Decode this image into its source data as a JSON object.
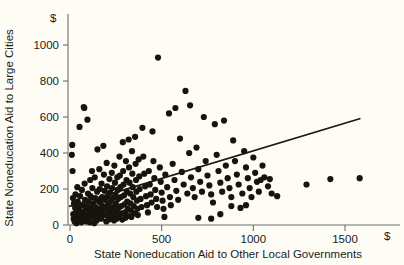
{
  "chart_data": {
    "type": "scatter",
    "title": "",
    "xlabel": "State Noneducation Aid to Other Local Governments",
    "ylabel": "State Noneducation Aid to Large Cities",
    "x_unit_symbol": "$",
    "y_unit_symbol": "$",
    "grid": false,
    "legend": null,
    "xlim": [
      0,
      1750
    ],
    "ylim": [
      0,
      1080
    ],
    "xticks": [
      0,
      500,
      1000,
      1500
    ],
    "yticks": [
      0,
      200,
      400,
      600,
      800,
      1000
    ],
    "xtick_labels": [
      "0",
      "500",
      "1000",
      "1500"
    ],
    "ytick_labels": [
      "0",
      "200",
      "400",
      "600",
      "800",
      "1000"
    ],
    "trendline": {
      "type": "linear-fit",
      "x_start": 0,
      "y_start": 105,
      "x_end": 1580,
      "y_end": 590
    },
    "points": [
      [
        10,
        390
      ],
      [
        12,
        445
      ],
      [
        14,
        300
      ],
      [
        16,
        150
      ],
      [
        18,
        60
      ],
      [
        20,
        35
      ],
      [
        22,
        120
      ],
      [
        25,
        20
      ],
      [
        28,
        95
      ],
      [
        30,
        170
      ],
      [
        32,
        55
      ],
      [
        35,
        10
      ],
      [
        38,
        80
      ],
      [
        40,
        210
      ],
      [
        42,
        130
      ],
      [
        45,
        45
      ],
      [
        48,
        25
      ],
      [
        50,
        100
      ],
      [
        52,
        545
      ],
      [
        55,
        160
      ],
      [
        58,
        75
      ],
      [
        60,
        40
      ],
      [
        62,
        15
      ],
      [
        65,
        195
      ],
      [
        68,
        110
      ],
      [
        70,
        60
      ],
      [
        72,
        30
      ],
      [
        75,
        655
      ],
      [
        78,
        650
      ],
      [
        80,
        230
      ],
      [
        82,
        140
      ],
      [
        85,
        85
      ],
      [
        88,
        50
      ],
      [
        90,
        20
      ],
      [
        92,
        105
      ],
      [
        95,
        585
      ],
      [
        98,
        175
      ],
      [
        100,
        130
      ],
      [
        102,
        70
      ],
      [
        105,
        45
      ],
      [
        108,
        15
      ],
      [
        110,
        250
      ],
      [
        112,
        160
      ],
      [
        115,
        95
      ],
      [
        118,
        55
      ],
      [
        120,
        300
      ],
      [
        122,
        205
      ],
      [
        125,
        120
      ],
      [
        128,
        80
      ],
      [
        130,
        40
      ],
      [
        132,
        10
      ],
      [
        135,
        265
      ],
      [
        138,
        150
      ],
      [
        140,
        100
      ],
      [
        142,
        60
      ],
      [
        145,
        25
      ],
      [
        148,
        185
      ],
      [
        150,
        420
      ],
      [
        152,
        135
      ],
      [
        155,
        90
      ],
      [
        158,
        50
      ],
      [
        160,
        310
      ],
      [
        162,
        200
      ],
      [
        165,
        125
      ],
      [
        168,
        75
      ],
      [
        170,
        35
      ],
      [
        172,
        230
      ],
      [
        175,
        155
      ],
      [
        178,
        105
      ],
      [
        180,
        65
      ],
      [
        182,
        440
      ],
      [
        185,
        280
      ],
      [
        188,
        190
      ],
      [
        190,
        140
      ],
      [
        192,
        95
      ],
      [
        195,
        55
      ],
      [
        198,
        20
      ],
      [
        200,
        345
      ],
      [
        202,
        215
      ],
      [
        205,
        160
      ],
      [
        208,
        115
      ],
      [
        210,
        70
      ],
      [
        212,
        30
      ],
      [
        215,
        255
      ],
      [
        218,
        180
      ],
      [
        220,
        130
      ],
      [
        222,
        85
      ],
      [
        225,
        45
      ],
      [
        228,
        290
      ],
      [
        230,
        205
      ],
      [
        232,
        150
      ],
      [
        235,
        100
      ],
      [
        238,
        60
      ],
      [
        240,
        25
      ],
      [
        242,
        330
      ],
      [
        245,
        235
      ],
      [
        248,
        170
      ],
      [
        250,
        120
      ],
      [
        252,
        75
      ],
      [
        255,
        35
      ],
      [
        258,
        265
      ],
      [
        260,
        195
      ],
      [
        262,
        145
      ],
      [
        265,
        95
      ],
      [
        268,
        55
      ],
      [
        270,
        380
      ],
      [
        272,
        275
      ],
      [
        275,
        210
      ],
      [
        278,
        155
      ],
      [
        280,
        105
      ],
      [
        282,
        65
      ],
      [
        285,
        30
      ],
      [
        288,
        460
      ],
      [
        290,
        300
      ],
      [
        292,
        225
      ],
      [
        295,
        165
      ],
      [
        298,
        115
      ],
      [
        300,
        70
      ],
      [
        302,
        40
      ],
      [
        305,
        355
      ],
      [
        308,
        250
      ],
      [
        310,
        185
      ],
      [
        312,
        130
      ],
      [
        315,
        90
      ],
      [
        318,
        50
      ],
      [
        320,
        475
      ],
      [
        322,
        320
      ],
      [
        325,
        235
      ],
      [
        328,
        175
      ],
      [
        330,
        120
      ],
      [
        332,
        80
      ],
      [
        335,
        45
      ],
      [
        338,
        410
      ],
      [
        340,
        285
      ],
      [
        342,
        210
      ],
      [
        345,
        155
      ],
      [
        348,
        105
      ],
      [
        350,
        65
      ],
      [
        355,
        490
      ],
      [
        358,
        340
      ],
      [
        360,
        250
      ],
      [
        362,
        185
      ],
      [
        365,
        135
      ],
      [
        368,
        90
      ],
      [
        370,
        55
      ],
      [
        375,
        365
      ],
      [
        378,
        270
      ],
      [
        380,
        200
      ],
      [
        385,
        145
      ],
      [
        390,
        100
      ],
      [
        395,
        540
      ],
      [
        400,
        380
      ],
      [
        405,
        285
      ],
      [
        410,
        215
      ],
      [
        415,
        160
      ],
      [
        420,
        110
      ],
      [
        425,
        70
      ],
      [
        430,
        300
      ],
      [
        435,
        225
      ],
      [
        440,
        170
      ],
      [
        445,
        125
      ],
      [
        450,
        520
      ],
      [
        455,
        355
      ],
      [
        460,
        260
      ],
      [
        465,
        195
      ],
      [
        470,
        145
      ],
      [
        475,
        100
      ],
      [
        480,
        930
      ],
      [
        490,
        320
      ],
      [
        495,
        240
      ],
      [
        500,
        180
      ],
      [
        505,
        135
      ],
      [
        510,
        90
      ],
      [
        515,
        45
      ],
      [
        520,
        280
      ],
      [
        530,
        210
      ],
      [
        540,
        620
      ],
      [
        545,
        155
      ],
      [
        550,
        110
      ],
      [
        560,
        340
      ],
      [
        570,
        250
      ],
      [
        575,
        650
      ],
      [
        580,
        190
      ],
      [
        590,
        140
      ],
      [
        600,
        480
      ],
      [
        610,
        295
      ],
      [
        620,
        225
      ],
      [
        630,
        745
      ],
      [
        640,
        175
      ],
      [
        650,
        400
      ],
      [
        655,
        665
      ],
      [
        660,
        265
      ],
      [
        670,
        205
      ],
      [
        680,
        155
      ],
      [
        690,
        430
      ],
      [
        700,
        310
      ],
      [
        710,
        240
      ],
      [
        720,
        185
      ],
      [
        730,
        600
      ],
      [
        740,
        355
      ],
      [
        750,
        275
      ],
      [
        760,
        220
      ],
      [
        770,
        170
      ],
      [
        780,
        125
      ],
      [
        790,
        560
      ],
      [
        800,
        390
      ],
      [
        810,
        300
      ],
      [
        820,
        235
      ],
      [
        830,
        185
      ],
      [
        840,
        580
      ],
      [
        850,
        330
      ],
      [
        860,
        260
      ],
      [
        870,
        205
      ],
      [
        880,
        155
      ],
      [
        890,
        470
      ],
      [
        900,
        355
      ],
      [
        910,
        280
      ],
      [
        920,
        225
      ],
      [
        930,
        95
      ],
      [
        940,
        175
      ],
      [
        950,
        410
      ],
      [
        960,
        320
      ],
      [
        970,
        260
      ],
      [
        980,
        205
      ],
      [
        990,
        155
      ],
      [
        1000,
        375
      ],
      [
        1010,
        290
      ],
      [
        1020,
        240
      ],
      [
        1030,
        185
      ],
      [
        1050,
        330
      ],
      [
        1060,
        265
      ],
      [
        1080,
        215
      ],
      [
        1100,
        175
      ],
      [
        880,
        105
      ],
      [
        960,
        110
      ],
      [
        1040,
        250
      ],
      [
        1090,
        255
      ],
      [
        1130,
        160
      ],
      [
        770,
        35
      ],
      [
        820,
        60
      ],
      [
        700,
        40
      ],
      [
        1290,
        225
      ],
      [
        1420,
        255
      ],
      [
        1580,
        260
      ]
    ]
  }
}
